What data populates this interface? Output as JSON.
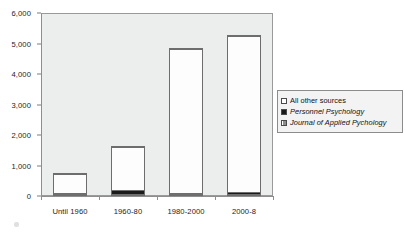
{
  "chart_data": {
    "type": "bar",
    "subtype": "stacked-column",
    "title": "",
    "subtitle": "",
    "xlabel": "",
    "ylabel": "",
    "categories": [
      "Until 1960",
      "1960-80",
      "1980-2000",
      "2000-8"
    ],
    "series": [
      {
        "name": "Journal of Applied Pychology",
        "color": "#6f6f6f",
        "values": [
          20,
          40,
          30,
          40
        ]
      },
      {
        "name": "Personnel Psychology",
        "color": "#1a1a1a",
        "values": [
          40,
          110,
          50,
          60
        ]
      },
      {
        "name": "All other sources",
        "color": "#ffffff",
        "values": [
          630,
          1430,
          4710,
          5110
        ]
      }
    ],
    "totals": [
      690,
      1580,
      4790,
      5210
    ],
    "ylim": [
      0,
      6000
    ],
    "ytick_values": [
      0,
      1000,
      2000,
      3000,
      4000,
      5000,
      6000
    ],
    "ytick_labels": [
      "0",
      "1,000",
      "2,000",
      "3,000",
      "4,000",
      "5,000",
      "6,000"
    ],
    "grid": false,
    "legend_position": "right",
    "plot_background": "#eceded"
  },
  "legend": {
    "items": [
      {
        "label": "All other sources",
        "swatch": "legend-swatch-white",
        "italic": false
      },
      {
        "label": "Personnel Psychology",
        "swatch": "legend-swatch-black",
        "italic": true
      },
      {
        "label": "Journal of Applied Pychology",
        "swatch": "legend-swatch-gray",
        "italic": true
      }
    ]
  }
}
